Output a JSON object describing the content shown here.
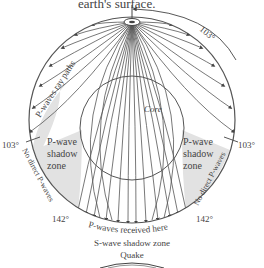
{
  "caption_fragment": "earth's surface.",
  "labels": {
    "angle_top": "103°",
    "angle_left": "103°",
    "angle_right": "103°",
    "angle_bottom_left": "142°",
    "angle_bottom_right": "142°",
    "ray_paths": "P-waves ray paths",
    "core": "Core",
    "shadow_left_1": "P-wave",
    "shadow_left_2": "shadow",
    "shadow_left_3": "zone",
    "shadow_right_1": "P-wave",
    "shadow_right_2": "shadow",
    "shadow_right_3": "zone",
    "no_direct_left": "No direct P-waves",
    "no_direct_right": "No direct P-waves",
    "received": "P-waves received here",
    "s_shadow": "S-wave shadow zone",
    "quake": "Quake"
  },
  "colors": {
    "line": "#555555",
    "shadow_fill": "#e2e2e2",
    "text": "#444444"
  }
}
